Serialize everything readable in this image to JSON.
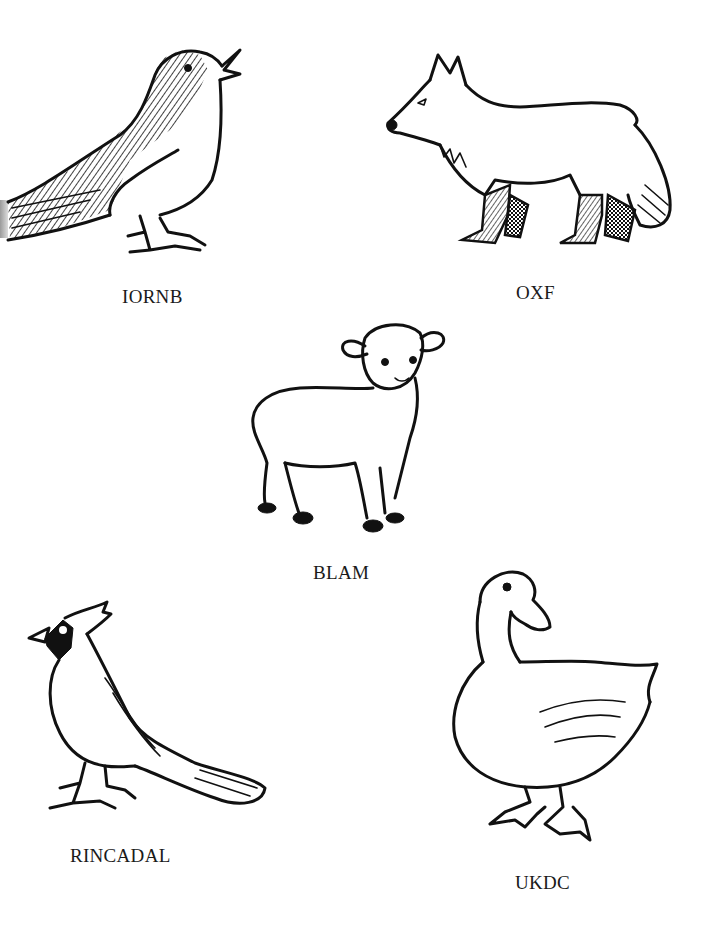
{
  "worksheet": {
    "type": "unscramble-animal-names",
    "items": [
      {
        "id": "bird",
        "scrambled_label": "IORNB",
        "drawing": "songbird-icon"
      },
      {
        "id": "fox",
        "scrambled_label": "OXF",
        "drawing": "fox-icon"
      },
      {
        "id": "lamb",
        "scrambled_label": "BLAM",
        "drawing": "lamb-icon"
      },
      {
        "id": "cardinal",
        "scrambled_label": "RINCADAL",
        "drawing": "cardinal-icon"
      },
      {
        "id": "duck",
        "scrambled_label": "UKDC",
        "drawing": "duck-icon"
      }
    ],
    "colors": {
      "background": "#ffffff",
      "ink": "#111111",
      "label_text": "#1a1a1a"
    }
  }
}
